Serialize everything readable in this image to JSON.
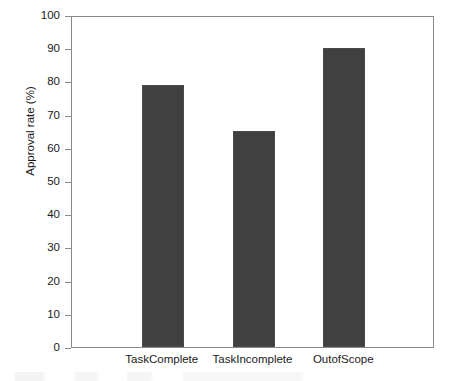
{
  "chart_data": {
    "type": "bar",
    "title": "",
    "subtitle": "",
    "xlabel": "",
    "ylabel": "Approval rate (%)",
    "categories": [
      "TaskComplete",
      "TaskIncomplete",
      "OutofScope"
    ],
    "values": [
      79,
      65,
      90
    ],
    "ylim": [
      0,
      100
    ],
    "xlim": [
      0,
      4
    ],
    "yticks": [
      0,
      10,
      20,
      30,
      40,
      50,
      60,
      70,
      80,
      90,
      100
    ],
    "ytick_labels": [
      "0",
      "10",
      "20",
      "30",
      "40",
      "50",
      "60",
      "70",
      "80",
      "90",
      "100"
    ],
    "grid": false,
    "legend": null,
    "legend_position": "none",
    "series": [
      {
        "name": "Approval rate",
        "values": [
          79,
          65,
          90
        ],
        "color": "#404040"
      }
    ],
    "bar_color": "#404040",
    "bar_edge_color": "#4a4a4a",
    "axis_color": "#8a8a8a",
    "background_color": "#ffffff",
    "text_color": "#1a1a1a"
  }
}
